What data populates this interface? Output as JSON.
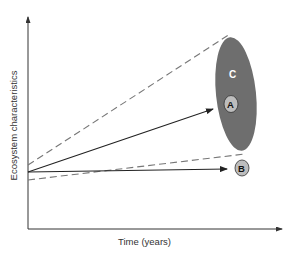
{
  "diagram": {
    "axes": {
      "y_label": "Ecosystem characteristics",
      "x_label": "Time (years)"
    },
    "labels": {
      "region_c": "C",
      "point_a": "A",
      "point_b": "B"
    },
    "colors": {
      "background": "#ffffff",
      "axis": "#333333",
      "ellipse_c": "#6e6e6e",
      "circle_fill": "#bdbdbd",
      "dashed": "#777777",
      "arrow": "#222222",
      "label_c": "#ffffff"
    },
    "elements": [
      {
        "type": "dashed-line",
        "name": "upper-bound",
        "from": [
          28,
          165
        ],
        "to": [
          230,
          34
        ]
      },
      {
        "type": "arrow",
        "name": "trajectory-to-A",
        "from": [
          28,
          172
        ],
        "to": [
          213,
          109
        ]
      },
      {
        "type": "dashed-line",
        "name": "lower-bound",
        "from": [
          28,
          180
        ],
        "to": [
          245,
          154
        ]
      },
      {
        "type": "arrow",
        "name": "trajectory-to-B",
        "from": [
          28,
          172
        ],
        "to": [
          227,
          169
        ]
      },
      {
        "type": "ellipse",
        "name": "region-C",
        "center": [
          236,
          94
        ],
        "rx": 20,
        "ry": 57
      },
      {
        "type": "circle",
        "name": "state-A",
        "center": [
          231,
          104
        ],
        "r": 7
      },
      {
        "type": "circle",
        "name": "state-B",
        "center": [
          242,
          168
        ],
        "r": 7
      }
    ]
  }
}
